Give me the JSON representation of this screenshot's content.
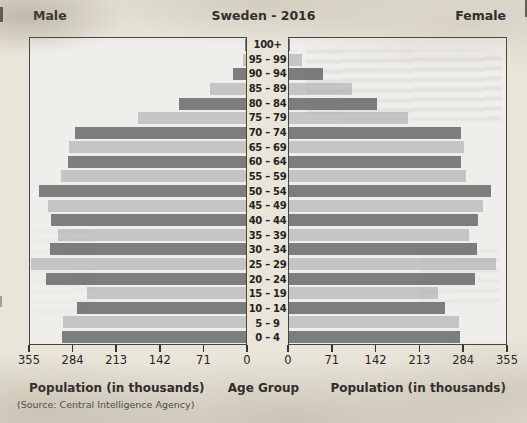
{
  "header": {
    "male_label": "Male",
    "title": "Sweden - 2016",
    "female_label": "Female"
  },
  "axis": {
    "left_ticks": [
      "355",
      "284",
      "213",
      "142",
      "71",
      "0"
    ],
    "right_ticks": [
      "0",
      "71",
      "142",
      "213",
      "284",
      "355"
    ],
    "left_axis_title": "Population (in thousands)",
    "center_axis_title": "Age Group",
    "right_axis_title": "Population (in thousands)",
    "source": "(Source: Central Intelligence Agency)"
  },
  "colors": {
    "bar_dark": "#7b7e7a",
    "bar_light": "#c4c6c3",
    "plot_background": "#f0eeea",
    "page_background": "#e9e5d9",
    "border": "#45443f",
    "text": "#232323"
  },
  "chart_data": {
    "type": "bar",
    "subtype": "population-pyramid",
    "title": "Sweden - 2016",
    "xlabel": "Population (in thousands)",
    "ylabel": "Age Group",
    "xlim": [
      0,
      355
    ],
    "x_ticks": [
      0,
      71,
      142,
      213,
      284,
      355
    ],
    "grid": false,
    "legend_position": "none",
    "units": "thousands",
    "categories_top_to_bottom": [
      "100+",
      "95 – 99",
      "90 – 94",
      "85 – 89",
      "80 – 84",
      "75 – 79",
      "70 – 74",
      "65 – 69",
      "60 – 64",
      "55 – 59",
      "50 – 54",
      "45 – 49",
      "40 – 44",
      "35 – 39",
      "30 – 34",
      "25 – 29",
      "20 – 24",
      "15 – 19",
      "10 – 14",
      "5 – 9",
      "0 – 4"
    ],
    "series": [
      {
        "name": "Male",
        "side": "left",
        "values": [
          1,
          5,
          21,
          60,
          110,
          178,
          281,
          291,
          293,
          304,
          340,
          326,
          320,
          309,
          322,
          354,
          328,
          262,
          277,
          300,
          303
        ]
      },
      {
        "name": "Female",
        "side": "right",
        "values": [
          2,
          22,
          55,
          103,
          144,
          195,
          281,
          287,
          281,
          289,
          330,
          317,
          309,
          295,
          307,
          338,
          305,
          244,
          256,
          278,
          279
        ]
      }
    ],
    "source": "(Source: Central Intelligence Agency)"
  }
}
